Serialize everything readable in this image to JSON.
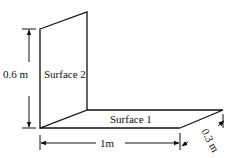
{
  "diagram": {
    "surfaces": [
      {
        "id": "surface-1",
        "label": "Surface 1",
        "orientation": "horizontal"
      },
      {
        "id": "surface-2",
        "label": "Surface 2",
        "orientation": "vertical"
      }
    ],
    "dimensions": {
      "height": "0.6 m",
      "length": "1m",
      "depth": "0.3 m"
    },
    "colors": {
      "line": "#111111",
      "background": "#ffffff"
    }
  }
}
